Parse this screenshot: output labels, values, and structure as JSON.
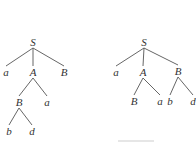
{
  "diagram": {
    "type": "parse-trees",
    "trees": [
      {
        "name": "left-tree",
        "nodes": [
          {
            "id": "S",
            "label": "S",
            "x": 33,
            "y": 42
          },
          {
            "id": "a1",
            "label": "a",
            "x": 6,
            "y": 72
          },
          {
            "id": "A",
            "label": "A",
            "x": 33,
            "y": 72
          },
          {
            "id": "B1",
            "label": "B",
            "x": 64,
            "y": 72
          },
          {
            "id": "B2",
            "label": "B",
            "x": 19,
            "y": 102
          },
          {
            "id": "a2",
            "label": "a",
            "x": 47,
            "y": 102
          },
          {
            "id": "b",
            "label": "b",
            "x": 9,
            "y": 131
          },
          {
            "id": "d",
            "label": "d",
            "x": 32,
            "y": 131
          }
        ],
        "edges": [
          [
            "S",
            "a1"
          ],
          [
            "S",
            "A"
          ],
          [
            "S",
            "B1"
          ],
          [
            "A",
            "B2"
          ],
          [
            "A",
            "a2"
          ],
          [
            "B2",
            "b"
          ],
          [
            "B2",
            "d"
          ]
        ]
      },
      {
        "name": "right-tree",
        "nodes": [
          {
            "id": "S",
            "label": "S",
            "x": 144,
            "y": 42
          },
          {
            "id": "a1",
            "label": "a",
            "x": 116,
            "y": 72
          },
          {
            "id": "A",
            "label": "A",
            "x": 143,
            "y": 72
          },
          {
            "id": "B1",
            "label": "B",
            "x": 178,
            "y": 71
          },
          {
            "id": "B2",
            "label": "B",
            "x": 134,
            "y": 101
          },
          {
            "id": "a2",
            "label": "a",
            "x": 160,
            "y": 101
          },
          {
            "id": "b",
            "label": "b",
            "x": 170,
            "y": 101
          },
          {
            "id": "d",
            "label": "d",
            "x": 193,
            "y": 101
          }
        ],
        "edges": [
          [
            "S",
            "a1"
          ],
          [
            "S",
            "A"
          ],
          [
            "S",
            "B1"
          ],
          [
            "A",
            "B2"
          ],
          [
            "A",
            "a2"
          ],
          [
            "B1",
            "b"
          ],
          [
            "B1",
            "d"
          ]
        ]
      }
    ],
    "line_color": "#555555",
    "text_color": "#333333"
  }
}
